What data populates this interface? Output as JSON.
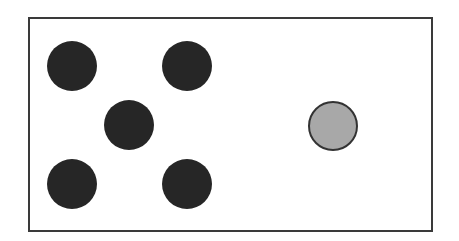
{
  "diagram": {
    "frame": {
      "x": 28,
      "y": 17,
      "width": 406,
      "height": 216,
      "border_color": "#3a3a3a"
    },
    "dots": [
      {
        "cx": 72,
        "cy": 66,
        "r": 25,
        "fill": "#262626",
        "kind": "dark"
      },
      {
        "cx": 187,
        "cy": 66,
        "r": 25,
        "fill": "#262626",
        "kind": "dark"
      },
      {
        "cx": 129,
        "cy": 125,
        "r": 25,
        "fill": "#262626",
        "kind": "dark"
      },
      {
        "cx": 72,
        "cy": 184,
        "r": 25,
        "fill": "#262626",
        "kind": "dark"
      },
      {
        "cx": 187,
        "cy": 184,
        "r": 25,
        "fill": "#262626",
        "kind": "dark"
      },
      {
        "cx": 333,
        "cy": 126,
        "r": 25,
        "fill": "#a8a8a8",
        "stroke": "#333333",
        "kind": "gray"
      }
    ]
  }
}
